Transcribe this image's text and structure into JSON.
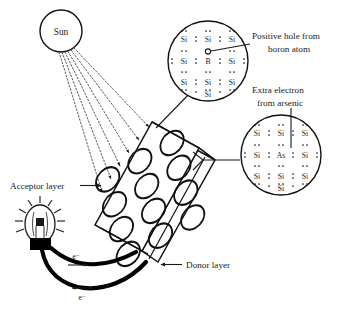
{
  "figure": {
    "background_color": "#ffffff",
    "ink_color": "#1a1a1a"
  },
  "sun": {
    "label": "Sun",
    "ray_count": 6,
    "ray_style": "dotted-with-arrowhead"
  },
  "panel": {
    "acceptor_label": "Acceptor layer",
    "donor_label": "Donor layer",
    "cell_rows": 4,
    "cell_columns": 3,
    "cell_shape": "ellipse"
  },
  "circuit": {
    "bulb_name": "light-bulb",
    "electron_top_label": "e⁻",
    "electron_bottom_label": "e⁻",
    "top_arrow_direction": "right",
    "bottom_arrow_direction": "left"
  },
  "lattice_top": {
    "name": "p-type boron doped silicon lattice",
    "callout_line1": "Positive hole from",
    "callout_line2": "boron atom",
    "dopant": "B",
    "host": "Si",
    "rows": [
      [
        "Si",
        "Si",
        "Si"
      ],
      [
        "Si",
        "B",
        "Si"
      ],
      [
        "Si",
        "Si",
        "Si"
      ]
    ],
    "bottom_atom": "Si",
    "hole_marker": "open-circle"
  },
  "lattice_bottom": {
    "name": "n-type arsenic doped silicon lattice",
    "callout_line1": "Extra electron",
    "callout_line2": "from arsenic",
    "dopant": "As",
    "host": "Si",
    "rows": [
      [
        "Si",
        "Si",
        "Si"
      ],
      [
        "Si",
        "As",
        "Si"
      ],
      [
        "Si",
        "Si",
        "Si"
      ]
    ],
    "bottom_atom": "Si",
    "electron_marker": "vertical-leader-line"
  }
}
